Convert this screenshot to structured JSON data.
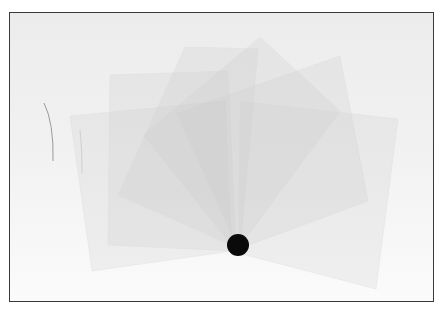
{
  "image": {
    "description": "Photograph of several translucent rectangular sheets fanned out around a black pivot point, on a light gray background inside a thin dark frame",
    "colors": {
      "background_top": "#ececec",
      "background_bottom": "#fbfbfb",
      "sheet_fill": "#c8c8c8",
      "pivot": "#0a0a0a",
      "frame_border": "#3a3a3a"
    },
    "sheets": [
      {
        "points": "60,103 215,88 222,238 82,258"
      },
      {
        "points": "100,62 218,58 226,238 98,232"
      },
      {
        "points": "175,34 248,36 230,236 108,182"
      },
      {
        "points": "250,24 330,98 226,238 133,122"
      },
      {
        "points": "330,43 358,188 228,236 166,100"
      },
      {
        "points": "230,88 388,106 366,276 228,240"
      }
    ],
    "pivot": {
      "cx": 228,
      "cy": 232,
      "r": 11
    },
    "scratches": [
      {
        "d": "M34 90 Q44 110 43 148"
      },
      {
        "d": "M70 117 Q72 135 72 160"
      }
    ]
  }
}
